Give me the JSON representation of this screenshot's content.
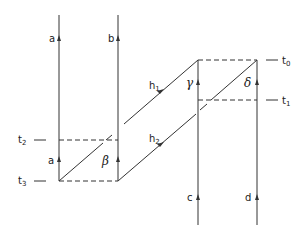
{
  "diagram": {
    "type": "spacetime-worldline-diagram",
    "line_color": "#333333",
    "worldlines": {
      "a": {
        "label": "a",
        "lower_label": "a"
      },
      "b": {
        "label": "b",
        "lower_label": "β"
      },
      "c": {
        "label": "c",
        "upper_label": "γ"
      },
      "d": {
        "label": "d",
        "upper_label": "δ"
      }
    },
    "diagonals": {
      "h1": {
        "label": "h",
        "sub": "1"
      },
      "h2": {
        "label": "h",
        "sub": "2"
      }
    },
    "time_levels": [
      {
        "label": "t",
        "sub": "0"
      },
      {
        "label": "t",
        "sub": "1"
      },
      {
        "label": "t",
        "sub": "2"
      },
      {
        "label": "t",
        "sub": "3"
      }
    ]
  }
}
